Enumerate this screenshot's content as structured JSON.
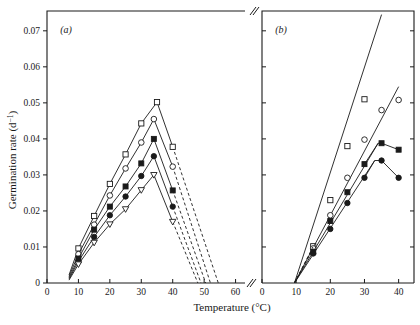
{
  "figure": {
    "xlabel": "Temperature (°C)",
    "ylabel_main": "Germination rate",
    "ylabel_unit": "(d",
    "ylabel_unit_exp": "−1",
    "ylabel_unit_close": ")",
    "ylabel_full": "Germination rate  (d−1)",
    "panel_a_label": "(a)",
    "panel_b_label": "(b)",
    "axis_break_symbol": "//"
  },
  "axes": {
    "y_ticks": [
      "0",
      "0.01",
      "0.02",
      "0.03",
      "0.04",
      "0.05",
      "0.06",
      "0.07"
    ],
    "y_tick_values": [
      0,
      0.01,
      0.02,
      0.03,
      0.04,
      0.05,
      0.06,
      0.07
    ],
    "y_min": 0,
    "y_max": 0.0755,
    "panel_a_x_ticks": [
      "0",
      "10",
      "20",
      "30",
      "40",
      "50",
      "60"
    ],
    "panel_a_x_tick_values": [
      0,
      10,
      20,
      30,
      40,
      50,
      60
    ],
    "panel_a_x_min": 0,
    "panel_a_x_max": 63,
    "panel_b_x_ticks": [
      "0",
      "10",
      "20",
      "30",
      "40"
    ],
    "panel_b_x_tick_values": [
      0,
      10,
      20,
      30,
      40
    ],
    "panel_b_x_min": 0,
    "panel_b_x_max": 44.5,
    "grid": false,
    "legend": "none"
  },
  "chart_data": {
    "type": "line",
    "title": "",
    "xlabel": "Temperature (°C)",
    "ylabel": "Germination rate (d−1)",
    "panels": [
      {
        "label": "(a)",
        "xlim": [
          0,
          63
        ],
        "ylim": [
          0,
          0.0755
        ],
        "series": [
          {
            "name": "series-1-open-square",
            "marker": "open-square",
            "line": "solid",
            "x": [
              7,
              10,
              15,
              20,
              25,
              30,
              35,
              40
            ],
            "y": [
              0.0022,
              0.0096,
              0.0186,
              0.0275,
              0.0357,
              0.0443,
              0.0502,
              0.0378
            ],
            "extrapolation_dashed": {
              "x": [
                40,
                54.5
              ],
              "y": [
                0.0378,
                0.0
              ]
            }
          },
          {
            "name": "series-2-open-circle",
            "marker": "open-circle",
            "line": "solid",
            "x": [
              7,
              10,
              15,
              20,
              25,
              30,
              34,
              40
            ],
            "y": [
              0.0018,
              0.008,
              0.0162,
              0.0243,
              0.0318,
              0.039,
              0.0455,
              0.0323
            ],
            "extrapolation_dashed": {
              "x": [
                40,
                52.0
              ],
              "y": [
                0.0323,
                0.0
              ]
            }
          },
          {
            "name": "series-3-filled-square",
            "marker": "filled-square",
            "line": "solid",
            "x": [
              7,
              10,
              15,
              20,
              25,
              30,
              34,
              40
            ],
            "y": [
              0.0014,
              0.0068,
              0.0148,
              0.0212,
              0.0268,
              0.0332,
              0.04,
              0.0257
            ],
            "extrapolation_dashed": {
              "x": [
                40,
                50.5
              ],
              "y": [
                0.0257,
                0.0
              ]
            }
          },
          {
            "name": "series-4-filled-circle",
            "marker": "filled-circle",
            "line": "solid",
            "x": [
              7,
              10,
              15,
              20,
              25,
              30,
              34,
              40
            ],
            "y": [
              0.0011,
              0.006,
              0.0128,
              0.0188,
              0.024,
              0.0297,
              0.0352,
              0.0212
            ],
            "extrapolation_dashed": {
              "x": [
                40,
                49.0
              ],
              "y": [
                0.0212,
                0.0
              ]
            }
          },
          {
            "name": "series-5-open-triangle-down",
            "marker": "open-triangle-down",
            "line": "solid",
            "x": [
              7,
              10,
              15,
              20,
              25,
              30,
              34,
              40
            ],
            "y": [
              0.0008,
              0.0052,
              0.0112,
              0.0163,
              0.0205,
              0.0258,
              0.03,
              0.017
            ],
            "extrapolation_dashed": {
              "x": [
                40,
                48.0
              ],
              "y": [
                0.017,
                0.0
              ]
            }
          }
        ]
      },
      {
        "label": "(b)",
        "xlim": [
          0,
          44.5
        ],
        "ylim": [
          0,
          0.0755
        ],
        "series": [
          {
            "name": "series-1-open-square",
            "marker": "open-square",
            "line": "fit",
            "x": [
              15,
              20,
              25,
              30
            ],
            "y": [
              0.0102,
              0.023,
              0.038,
              0.051
            ],
            "fit": {
              "x": [
                9.5,
                35.0
              ],
              "y": [
                0.0,
                0.0745
              ]
            }
          },
          {
            "name": "series-2-open-circle",
            "marker": "open-circle",
            "line": "fit",
            "x": [
              15,
              20,
              25,
              30,
              35,
              40
            ],
            "y": [
              0.0096,
              0.0188,
              0.0292,
              0.0398,
              0.048,
              0.0508
            ],
            "fit": {
              "x": [
                9.5,
                40.0
              ],
              "y": [
                0.0,
                0.0545
              ]
            }
          },
          {
            "name": "series-3-filled-square",
            "marker": "filled-square",
            "line": "solid",
            "x": [
              15,
              20,
              25,
              30,
              34,
              35,
              40
            ],
            "y": [
              0.0086,
              0.0172,
              0.0252,
              0.033,
              0.0388,
              0.0388,
              0.037
            ],
            "fit": {
              "x": [
                9.5,
                34.0
              ],
              "y": [
                0.0,
                0.0388
              ]
            }
          },
          {
            "name": "series-4-filled-circle",
            "marker": "filled-circle",
            "line": "solid",
            "x": [
              15,
              20,
              25,
              30,
              33,
              35,
              40
            ],
            "y": [
              0.0082,
              0.015,
              0.0222,
              0.0292,
              0.034,
              0.034,
              0.0292
            ],
            "fit": {
              "x": [
                9.5,
                33.0
              ],
              "y": [
                0.0,
                0.034
              ]
            }
          }
        ]
      }
    ]
  }
}
